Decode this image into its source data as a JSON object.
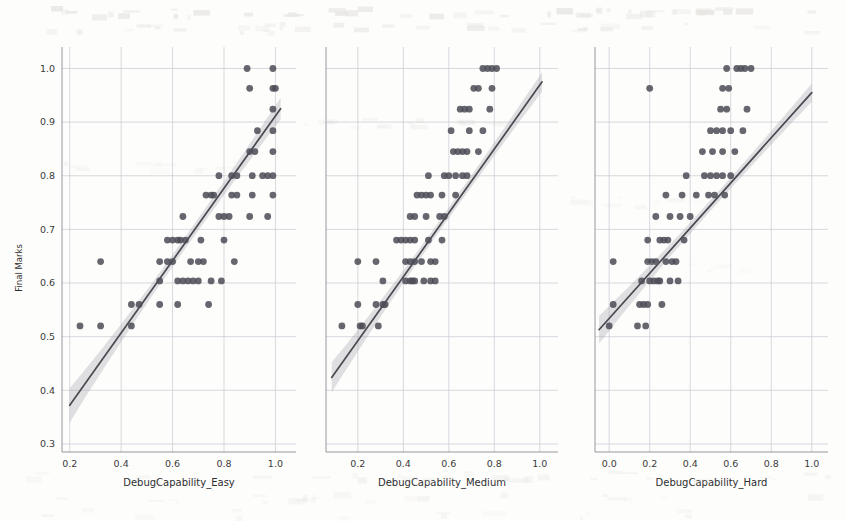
{
  "figure": {
    "background": "#fdfdfc",
    "point_color": "#4d4d57",
    "line_color": "#4a4a52",
    "band_color": "#9a9aa2",
    "grid_color": "#c9c9d2",
    "width": 846,
    "height": 521
  },
  "chart_data": [
    {
      "type": "scatter",
      "title": "",
      "xlabel": "DebugCapability_Easy",
      "ylabel": "Final Marks",
      "xlim": [
        0.17,
        1.08
      ],
      "ylim": [
        0.285,
        1.04
      ],
      "xticks": [
        0.2,
        0.4,
        0.6,
        0.8,
        1.0
      ],
      "xticklabels": [
        "0.2",
        "0.4",
        "0.6",
        "0.8",
        "1.0"
      ],
      "yticks": [
        0.3,
        0.4,
        0.5,
        0.6,
        0.7,
        0.8,
        0.9,
        1.0
      ],
      "yticklabels": [
        "0.3",
        "0.4",
        "0.5",
        "0.6",
        "0.7",
        "0.8",
        "0.9",
        "1.0"
      ],
      "grid": true,
      "legend": "none",
      "regression": {
        "x_start": 0.2,
        "y_start": 0.372,
        "x_end": 1.02,
        "y_end": 0.925,
        "ci_halfwidth_start": 0.032,
        "ci_halfwidth_mid": 0.011,
        "ci_halfwidth_end": 0.02
      },
      "points": [
        [
          0.24,
          0.52
        ],
        [
          0.32,
          0.52
        ],
        [
          0.44,
          0.52
        ],
        [
          0.32,
          0.64
        ],
        [
          0.44,
          0.56
        ],
        [
          0.47,
          0.56
        ],
        [
          0.55,
          0.56
        ],
        [
          0.62,
          0.56
        ],
        [
          0.74,
          0.56
        ],
        [
          0.55,
          0.604
        ],
        [
          0.62,
          0.604
        ],
        [
          0.64,
          0.604
        ],
        [
          0.66,
          0.604
        ],
        [
          0.68,
          0.604
        ],
        [
          0.7,
          0.604
        ],
        [
          0.75,
          0.604
        ],
        [
          0.79,
          0.604
        ],
        [
          0.55,
          0.64
        ],
        [
          0.58,
          0.64
        ],
        [
          0.6,
          0.64
        ],
        [
          0.67,
          0.64
        ],
        [
          0.7,
          0.64
        ],
        [
          0.72,
          0.64
        ],
        [
          0.84,
          0.64
        ],
        [
          0.58,
          0.68
        ],
        [
          0.6,
          0.68
        ],
        [
          0.62,
          0.68
        ],
        [
          0.63,
          0.68
        ],
        [
          0.65,
          0.68
        ],
        [
          0.71,
          0.68
        ],
        [
          0.8,
          0.68
        ],
        [
          0.64,
          0.724
        ],
        [
          0.78,
          0.724
        ],
        [
          0.8,
          0.724
        ],
        [
          0.82,
          0.724
        ],
        [
          0.9,
          0.724
        ],
        [
          0.97,
          0.724
        ],
        [
          0.73,
          0.764
        ],
        [
          0.75,
          0.764
        ],
        [
          0.76,
          0.764
        ],
        [
          0.83,
          0.764
        ],
        [
          0.85,
          0.764
        ],
        [
          0.91,
          0.764
        ],
        [
          0.99,
          0.764
        ],
        [
          0.78,
          0.8
        ],
        [
          0.83,
          0.8
        ],
        [
          0.85,
          0.8
        ],
        [
          0.91,
          0.8
        ],
        [
          0.95,
          0.8
        ],
        [
          0.97,
          0.8
        ],
        [
          0.99,
          0.8
        ],
        [
          0.9,
          0.845
        ],
        [
          0.92,
          0.845
        ],
        [
          0.99,
          0.845
        ],
        [
          0.93,
          0.884
        ],
        [
          0.99,
          0.884
        ],
        [
          0.99,
          0.924
        ],
        [
          0.9,
          0.963
        ],
        [
          0.99,
          0.963
        ],
        [
          1.0,
          0.963
        ],
        [
          0.89,
          1.0
        ],
        [
          0.99,
          1.0
        ]
      ]
    },
    {
      "type": "scatter",
      "title": "",
      "xlabel": "DebugCapability_Medium",
      "ylabel": "",
      "xlim": [
        0.06,
        1.08
      ],
      "ylim": [
        0.285,
        1.04
      ],
      "xticks": [
        0.2,
        0.4,
        0.6,
        0.8,
        1.0
      ],
      "xticklabels": [
        "0.2",
        "0.4",
        "0.6",
        "0.8",
        "1.0"
      ],
      "yticks": [
        0.3,
        0.4,
        0.5,
        0.6,
        0.7,
        0.8,
        0.9,
        1.0
      ],
      "yticklabels": [
        "",
        "",
        "",
        "",
        "",
        "",
        "",
        ""
      ],
      "grid": true,
      "legend": "none",
      "regression": {
        "x_start": 0.085,
        "y_start": 0.424,
        "x_end": 1.01,
        "y_end": 0.975,
        "ci_halfwidth_start": 0.028,
        "ci_halfwidth_mid": 0.01,
        "ci_halfwidth_end": 0.018
      },
      "points": [
        [
          0.13,
          0.52
        ],
        [
          0.21,
          0.52
        ],
        [
          0.22,
          0.52
        ],
        [
          0.29,
          0.52
        ],
        [
          0.2,
          0.56
        ],
        [
          0.28,
          0.56
        ],
        [
          0.31,
          0.56
        ],
        [
          0.32,
          0.56
        ],
        [
          0.31,
          0.604
        ],
        [
          0.41,
          0.604
        ],
        [
          0.43,
          0.604
        ],
        [
          0.44,
          0.604
        ],
        [
          0.45,
          0.604
        ],
        [
          0.49,
          0.604
        ],
        [
          0.52,
          0.604
        ],
        [
          0.54,
          0.604
        ],
        [
          0.2,
          0.64
        ],
        [
          0.28,
          0.64
        ],
        [
          0.41,
          0.64
        ],
        [
          0.43,
          0.64
        ],
        [
          0.45,
          0.64
        ],
        [
          0.48,
          0.64
        ],
        [
          0.52,
          0.64
        ],
        [
          0.54,
          0.64
        ],
        [
          0.37,
          0.68
        ],
        [
          0.39,
          0.68
        ],
        [
          0.41,
          0.68
        ],
        [
          0.43,
          0.68
        ],
        [
          0.45,
          0.68
        ],
        [
          0.51,
          0.68
        ],
        [
          0.57,
          0.68
        ],
        [
          0.43,
          0.724
        ],
        [
          0.45,
          0.724
        ],
        [
          0.5,
          0.724
        ],
        [
          0.56,
          0.724
        ],
        [
          0.58,
          0.724
        ],
        [
          0.46,
          0.764
        ],
        [
          0.48,
          0.764
        ],
        [
          0.5,
          0.764
        ],
        [
          0.52,
          0.764
        ],
        [
          0.57,
          0.764
        ],
        [
          0.63,
          0.764
        ],
        [
          0.51,
          0.8
        ],
        [
          0.58,
          0.8
        ],
        [
          0.6,
          0.8
        ],
        [
          0.63,
          0.8
        ],
        [
          0.66,
          0.8
        ],
        [
          0.68,
          0.8
        ],
        [
          0.62,
          0.845
        ],
        [
          0.64,
          0.845
        ],
        [
          0.66,
          0.845
        ],
        [
          0.68,
          0.845
        ],
        [
          0.73,
          0.845
        ],
        [
          0.61,
          0.884
        ],
        [
          0.69,
          0.884
        ],
        [
          0.75,
          0.884
        ],
        [
          0.65,
          0.924
        ],
        [
          0.67,
          0.924
        ],
        [
          0.69,
          0.924
        ],
        [
          0.78,
          0.924
        ],
        [
          0.71,
          0.963
        ],
        [
          0.73,
          0.963
        ],
        [
          0.79,
          0.963
        ],
        [
          0.75,
          1.0
        ],
        [
          0.77,
          1.0
        ],
        [
          0.79,
          1.0
        ],
        [
          0.81,
          1.0
        ]
      ]
    },
    {
      "type": "scatter",
      "title": "",
      "xlabel": "DebugCapability_Hard",
      "ylabel": "",
      "xlim": [
        -0.07,
        1.08
      ],
      "ylim": [
        0.285,
        1.04
      ],
      "xticks": [
        0.0,
        0.2,
        0.4,
        0.6,
        0.8,
        1.0
      ],
      "xticklabels": [
        "0.0",
        "0.2",
        "0.4",
        "0.6",
        "0.8",
        "1.0"
      ],
      "yticks": [
        0.3,
        0.4,
        0.5,
        0.6,
        0.7,
        0.8,
        0.9,
        1.0
      ],
      "yticklabels": [
        "",
        "",
        "",
        "",
        "",
        "",
        "",
        ""
      ],
      "grid": true,
      "legend": "none",
      "regression": {
        "x_start": -0.05,
        "y_start": 0.513,
        "x_end": 1.0,
        "y_end": 0.955,
        "ci_halfwidth_start": 0.026,
        "ci_halfwidth_mid": 0.01,
        "ci_halfwidth_end": 0.017
      },
      "points": [
        [
          0.0,
          0.52
        ],
        [
          0.14,
          0.52
        ],
        [
          0.18,
          0.52
        ],
        [
          0.02,
          0.56
        ],
        [
          0.15,
          0.56
        ],
        [
          0.17,
          0.56
        ],
        [
          0.19,
          0.56
        ],
        [
          0.26,
          0.56
        ],
        [
          0.16,
          0.604
        ],
        [
          0.2,
          0.604
        ],
        [
          0.22,
          0.604
        ],
        [
          0.24,
          0.604
        ],
        [
          0.25,
          0.604
        ],
        [
          0.3,
          0.604
        ],
        [
          0.34,
          0.604
        ],
        [
          0.02,
          0.64
        ],
        [
          0.19,
          0.64
        ],
        [
          0.21,
          0.64
        ],
        [
          0.23,
          0.64
        ],
        [
          0.28,
          0.64
        ],
        [
          0.31,
          0.64
        ],
        [
          0.33,
          0.64
        ],
        [
          0.19,
          0.68
        ],
        [
          0.25,
          0.68
        ],
        [
          0.27,
          0.68
        ],
        [
          0.29,
          0.68
        ],
        [
          0.37,
          0.68
        ],
        [
          0.23,
          0.724
        ],
        [
          0.3,
          0.724
        ],
        [
          0.35,
          0.724
        ],
        [
          0.4,
          0.724
        ],
        [
          0.28,
          0.764
        ],
        [
          0.36,
          0.764
        ],
        [
          0.43,
          0.764
        ],
        [
          0.49,
          0.764
        ],
        [
          0.52,
          0.764
        ],
        [
          0.57,
          0.764
        ],
        [
          0.38,
          0.8
        ],
        [
          0.47,
          0.8
        ],
        [
          0.5,
          0.8
        ],
        [
          0.53,
          0.8
        ],
        [
          0.56,
          0.8
        ],
        [
          0.6,
          0.8
        ],
        [
          0.46,
          0.845
        ],
        [
          0.51,
          0.845
        ],
        [
          0.56,
          0.845
        ],
        [
          0.62,
          0.845
        ],
        [
          0.5,
          0.884
        ],
        [
          0.53,
          0.884
        ],
        [
          0.56,
          0.884
        ],
        [
          0.6,
          0.884
        ],
        [
          0.66,
          0.884
        ],
        [
          0.55,
          0.924
        ],
        [
          0.58,
          0.924
        ],
        [
          0.68,
          0.924
        ],
        [
          0.2,
          0.963
        ],
        [
          0.56,
          0.963
        ],
        [
          0.59,
          0.963
        ],
        [
          0.58,
          1.0
        ],
        [
          0.63,
          1.0
        ],
        [
          0.65,
          1.0
        ],
        [
          0.67,
          1.0
        ],
        [
          0.7,
          1.0
        ]
      ]
    }
  ],
  "panels_geometry": [
    {
      "x0": 62,
      "x1": 296,
      "y0": 47,
      "y1": 452,
      "name": "panel-easy"
    },
    {
      "x0": 326,
      "x1": 558,
      "y0": 47,
      "y1": 452,
      "name": "panel-medium"
    },
    {
      "x0": 595,
      "x1": 828,
      "y0": 47,
      "y1": 452,
      "name": "panel-hard"
    }
  ],
  "y_axis_title": "Final Marks"
}
